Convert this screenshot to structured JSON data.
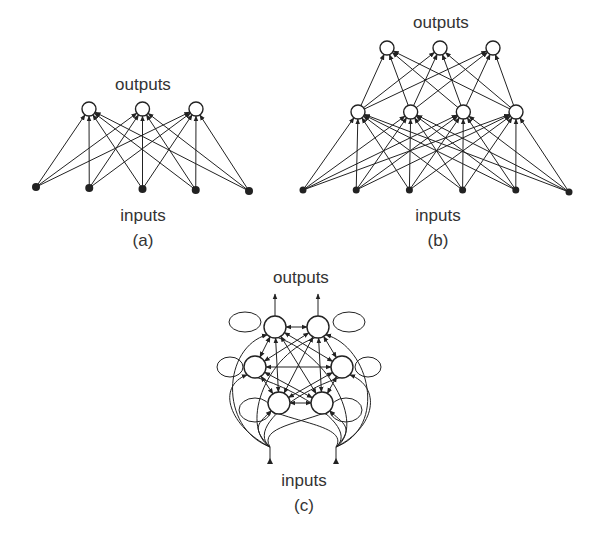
{
  "figure": {
    "panels": [
      {
        "id": "a",
        "caption": "(a)",
        "outputs_label": "outputs",
        "inputs_label": "inputs",
        "architecture": "single-layer feedforward",
        "layers": [
          {
            "name": "inputs",
            "count": 5
          },
          {
            "name": "outputs",
            "count": 3
          }
        ],
        "connectivity": "fully connected inputs to outputs"
      },
      {
        "id": "b",
        "caption": "(b)",
        "outputs_label": "outputs",
        "inputs_label": "inputs",
        "architecture": "multilayer feedforward",
        "layers": [
          {
            "name": "inputs",
            "count": 6
          },
          {
            "name": "hidden",
            "count": 4
          },
          {
            "name": "outputs",
            "count": 3
          }
        ],
        "connectivity": "fully connected between consecutive layers"
      },
      {
        "id": "c",
        "caption": "(c)",
        "outputs_label": "outputs",
        "inputs_label": "inputs",
        "architecture": "recurrent",
        "units": 6,
        "external_inputs": 2,
        "external_outputs": 2,
        "connectivity": "fully interconnected with self-loops"
      }
    ]
  }
}
